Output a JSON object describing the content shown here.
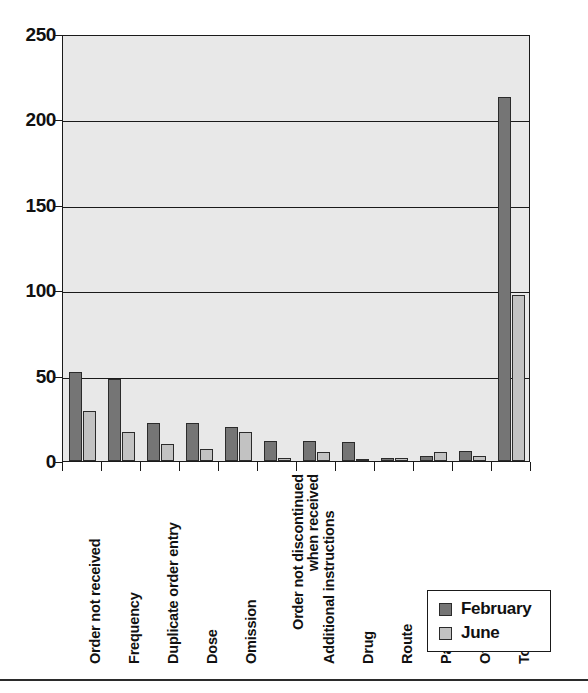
{
  "chart_data": {
    "type": "bar",
    "title": "",
    "xlabel": "",
    "ylabel": "",
    "ylim": [
      0,
      250
    ],
    "yticks": [
      0,
      50,
      100,
      150,
      200,
      250
    ],
    "grid": true,
    "legend_position": "bottom-right",
    "categories": [
      "Order not received",
      "Frequency",
      "Duplicate order entry",
      "Dose",
      "Omission",
      "Order not discontinued\nwhen received",
      "Additional instructions",
      "Drug",
      "Route",
      "Patient",
      "Other",
      "Total"
    ],
    "series": [
      {
        "name": "February",
        "color": "#757575",
        "values": [
          52,
          48,
          22,
          22,
          20,
          12,
          12,
          11,
          2,
          3,
          6,
          213
        ]
      },
      {
        "name": "June",
        "color": "#c2c2c2",
        "values": [
          29,
          17,
          10,
          7,
          17,
          2,
          5,
          1,
          2,
          5,
          3,
          97
        ]
      }
    ]
  },
  "legend": {
    "items": [
      {
        "label": "February",
        "swatch": "feb"
      },
      {
        "label": "June",
        "swatch": "jun"
      }
    ]
  },
  "colors": {
    "february": "#757575",
    "june": "#c2c2c2",
    "plot_background": "#e8e8e8",
    "axis": "#1a1a1a"
  }
}
